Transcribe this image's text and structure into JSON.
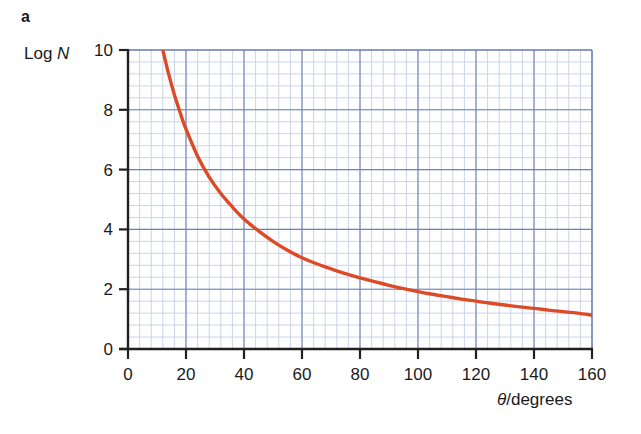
{
  "figure": {
    "panel_label": "a",
    "y_axis_title_prefix": "Log ",
    "y_axis_title_symbol": "N",
    "x_axis_title_symbol": "θ",
    "x_axis_title_suffix": "/degrees"
  },
  "chart_data": {
    "type": "line",
    "title": "",
    "subtitle": "",
    "xlabel": "θ/degrees",
    "ylabel": "Log N",
    "xlim": [
      0,
      160
    ],
    "ylim": [
      0,
      10
    ],
    "xticks": [
      0,
      20,
      40,
      60,
      80,
      100,
      120,
      140,
      160
    ],
    "xtick_labels": [
      "0",
      "20",
      "40",
      "60",
      "80",
      "100",
      "120",
      "140",
      "160"
    ],
    "yticks": [
      0,
      2,
      4,
      6,
      8,
      10
    ],
    "ytick_labels": [
      "0",
      "2",
      "4",
      "6",
      "8",
      "10"
    ],
    "grid": true,
    "grid_minor_step_x": 4,
    "grid_minor_step_y": 0.4,
    "grid_major_step_x": 20,
    "grid_major_step_y": 2,
    "legend": null,
    "series": [
      {
        "name": "Log N vs theta",
        "color": "#dc4a26",
        "line_width": 3.4,
        "x": [
          12,
          14,
          16,
          18,
          20,
          24,
          28,
          32,
          36,
          40,
          45,
          50,
          55,
          60,
          65,
          70,
          75,
          80,
          85,
          90,
          95,
          100,
          105,
          110,
          115,
          120,
          125,
          130,
          135,
          140,
          145,
          150,
          155,
          160
        ],
        "y": [
          10.0,
          9.2,
          8.5,
          7.9,
          7.35,
          6.45,
          5.75,
          5.2,
          4.75,
          4.35,
          3.95,
          3.6,
          3.3,
          3.05,
          2.85,
          2.68,
          2.52,
          2.38,
          2.25,
          2.13,
          2.02,
          1.92,
          1.83,
          1.75,
          1.67,
          1.6,
          1.53,
          1.47,
          1.41,
          1.36,
          1.3,
          1.25,
          1.2,
          1.13
        ]
      }
    ]
  },
  "colors": {
    "curve": "#dc4a26",
    "grid_minor": "#c9d4ea",
    "grid_major": "#6e82b4",
    "axis": "#231f20",
    "text": "#1a1a1a",
    "background": "#ffffff"
  },
  "geometry": {
    "plot_left": 128,
    "plot_right": 592,
    "plot_top": 50,
    "plot_bottom": 349
  }
}
